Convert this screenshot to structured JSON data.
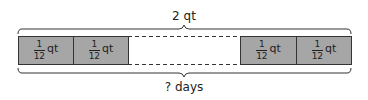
{
  "diagram": {
    "type": "tape-diagram",
    "total_label": "2 qt",
    "count_label": "? days",
    "segments": [
      {
        "numerator": "1",
        "denominator": "12",
        "unit": "qt"
      },
      {
        "numerator": "1",
        "denominator": "12",
        "unit": "qt"
      },
      {
        "numerator": "1",
        "denominator": "12",
        "unit": "qt"
      },
      {
        "numerator": "1",
        "denominator": "12",
        "unit": "qt"
      }
    ],
    "colors": {
      "segment_fill": "#a6a6a6",
      "stroke": "#333333"
    }
  }
}
